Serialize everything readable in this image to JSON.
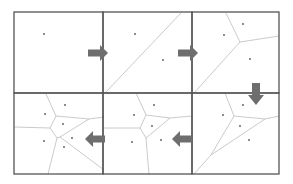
{
  "figure": {
    "colors": {
      "frame": "#555555",
      "edge": "#c4c4c4",
      "site": "#555555",
      "arrow": "#6e6e6e",
      "background": "#ffffff"
    },
    "flow": [
      "panel-1 → panel-2 (right)",
      "panel-2 → panel-3 (right)",
      "panel-3 → panel-6 (down)",
      "panel-6 → panel-5 (left)",
      "panel-5 → panel-4 (left)"
    ],
    "panels": [
      {
        "id": 1,
        "step": 1,
        "sites": [
          [
            44,
            34
          ]
        ],
        "edges": []
      },
      {
        "id": 2,
        "step": 2,
        "sites": [
          [
            135,
            34
          ],
          [
            163,
            60
          ]
        ],
        "edges": [
          [
            [
              105,
              93
            ],
            [
              181,
              13
            ]
          ]
        ]
      },
      {
        "id": 3,
        "step": 3,
        "sites": [
          [
            243,
            24
          ],
          [
            224,
            35
          ],
          [
            250,
            59
          ]
        ],
        "edges": [
          [
            [
              240,
              42
            ],
            [
              226,
              13
            ]
          ],
          [
            [
              240,
              42
            ],
            [
              279,
              36
            ]
          ],
          [
            [
              240,
              42
            ],
            [
              194,
              93
            ]
          ]
        ]
      },
      {
        "id": 6,
        "step": 4,
        "sites": [
          [
            243,
            105
          ],
          [
            223,
            115
          ],
          [
            240,
            126
          ],
          [
            249,
            140
          ]
        ],
        "edges": [
          [
            [
              225,
              93
            ],
            [
              234,
              116
            ]
          ],
          [
            [
              234,
              116
            ],
            [
              265,
              119
            ]
          ],
          [
            [
              265,
              119
            ],
            [
              279,
              116
            ]
          ],
          [
            [
              234,
              116
            ],
            [
              211,
              155
            ]
          ],
          [
            [
              265,
              119
            ],
            [
              211,
              155
            ]
          ],
          [
            [
              211,
              155
            ],
            [
              194,
              174
            ]
          ]
        ]
      },
      {
        "id": 5,
        "step": 5,
        "sites": [
          [
            154,
            105
          ],
          [
            134,
            115
          ],
          [
            152,
            126
          ],
          [
            132,
            142
          ],
          [
            161,
            140
          ]
        ],
        "edges": [
          [
            [
              136,
              93
            ],
            [
              146,
              115
            ]
          ],
          [
            [
              146,
              115
            ],
            [
              170,
              118
            ]
          ],
          [
            [
              170,
              118
            ],
            [
              192,
              116
            ]
          ],
          [
            [
              146,
              115
            ],
            [
              140,
              128
            ]
          ],
          [
            [
              140,
              128
            ],
            [
              104,
              128
            ]
          ],
          [
            [
              140,
              128
            ],
            [
              146,
              138
            ]
          ],
          [
            [
              146,
              138
            ],
            [
              149,
              175
            ]
          ],
          [
            [
              170,
              118
            ],
            [
              146,
              138
            ]
          ]
        ]
      },
      {
        "id": 4,
        "step": 6,
        "sites": [
          [
            65,
            105
          ],
          [
            45,
            114
          ],
          [
            63,
            124
          ],
          [
            44,
            141
          ],
          [
            64,
            147
          ],
          [
            72,
            138
          ]
        ],
        "edges": [
          [
            [
              46,
              94
            ],
            [
              56,
              116
            ]
          ],
          [
            [
              56,
              116
            ],
            [
              89,
              119
            ]
          ],
          [
            [
              89,
              119
            ],
            [
              104,
              117
            ]
          ],
          [
            [
              56,
              116
            ],
            [
              50,
              128
            ]
          ],
          [
            [
              50,
              128
            ],
            [
              14,
              127
            ]
          ],
          [
            [
              50,
              128
            ],
            [
              57,
              138
            ]
          ],
          [
            [
              57,
              138
            ],
            [
              48,
              174
            ]
          ],
          [
            [
              89,
              119
            ],
            [
              60,
              137
            ]
          ],
          [
            [
              60,
              137
            ],
            [
              104,
              170
            ]
          ],
          [
            [
              57,
              138
            ],
            [
              60,
              137
            ]
          ]
        ]
      }
    ],
    "arrows": [
      {
        "direction": "right",
        "from": 1,
        "to": 2,
        "x": 88,
        "y": 53
      },
      {
        "direction": "right",
        "from": 2,
        "to": 3,
        "x": 178,
        "y": 53
      },
      {
        "direction": "down",
        "from": 3,
        "to": 6,
        "x": 256,
        "y": 83
      },
      {
        "direction": "left",
        "from": 6,
        "to": 5,
        "x": 172,
        "y": 139
      },
      {
        "direction": "left",
        "from": 5,
        "to": 4,
        "x": 85,
        "y": 139
      }
    ]
  }
}
